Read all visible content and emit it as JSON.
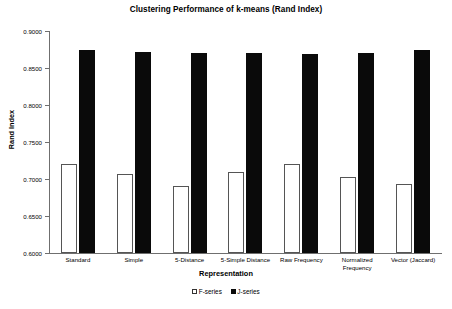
{
  "chart_data": {
    "type": "bar",
    "title": "Clustering Performance of k-means (Rand Index)",
    "xlabel": "Representation",
    "ylabel": "Rand Index",
    "ylim": [
      0.6,
      0.9
    ],
    "ytick_step": 0.05,
    "ytick_labels": [
      "0.9000",
      "0.8500",
      "0.8000",
      "0.7500",
      "0.7000",
      "0.6500",
      "0.6000"
    ],
    "ytick_values": [
      0.9,
      0.85,
      0.8,
      0.75,
      0.7,
      0.65,
      0.6
    ],
    "grid": false,
    "legend_position": "bottom",
    "categories": [
      "Standard",
      "Simple",
      "5-Distance",
      "5-Simple Distance",
      "Raw Frequency",
      "Normalized\nFrequency",
      "Vector (Jaccard)"
    ],
    "series": [
      {
        "name": "F-series",
        "color": "#ffffff",
        "edge_color": "#555555",
        "values": [
          0.72,
          0.707,
          0.69,
          0.709,
          0.72,
          0.703,
          0.693
        ]
      },
      {
        "name": "J-series",
        "color": "#0a0a0a",
        "edge_color": "#0a0a0a",
        "values": [
          0.875,
          0.872,
          0.87,
          0.87,
          0.869,
          0.87,
          0.875
        ]
      }
    ]
  },
  "legend": {
    "items": [
      {
        "label": "F-series",
        "style": "open"
      },
      {
        "label": "J-series",
        "style": "filled"
      }
    ]
  }
}
